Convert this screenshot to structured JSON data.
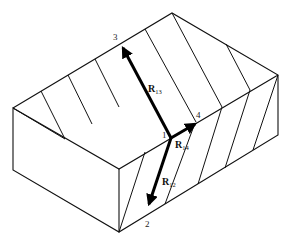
{
  "figure": {
    "type": "isometric crystal block with cleavage hatching and vectors",
    "points": [
      {
        "id": "1",
        "label": "1"
      },
      {
        "id": "2",
        "label": "2"
      },
      {
        "id": "3",
        "label": "3"
      },
      {
        "id": "4",
        "label": "4"
      }
    ],
    "vectors": [
      {
        "name": "R13",
        "label_main": "R",
        "label_sub": "13",
        "from": "1",
        "to": "3"
      },
      {
        "name": "R12",
        "label_main": "R",
        "label_sub": "12",
        "from": "1",
        "to": "2"
      },
      {
        "name": "R14",
        "label_main": "R",
        "label_sub": "14",
        "from": "1",
        "to": "4"
      }
    ],
    "colors": {
      "line": "#111111",
      "background": "#ffffff"
    }
  }
}
